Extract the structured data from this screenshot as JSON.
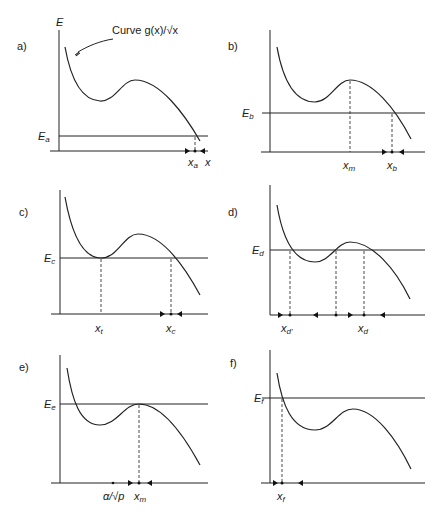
{
  "figure": {
    "annotation": "Curve g(x)/√x",
    "y_axis_label": "E",
    "x_axis_label": "x",
    "panels": [
      {
        "id": "a",
        "label": "a)",
        "energy_label": "E",
        "energy_sub": "a",
        "points": [
          {
            "name": "x",
            "sub": "a"
          }
        ],
        "extra_axis_label": "x"
      },
      {
        "id": "b",
        "label": "b)",
        "energy_label": "E",
        "energy_sub": "b",
        "points": [
          {
            "name": "x",
            "sub": "m"
          },
          {
            "name": "x",
            "sub": "b"
          }
        ]
      },
      {
        "id": "c",
        "label": "c)",
        "energy_label": "E",
        "energy_sub": "c",
        "points": [
          {
            "name": "x",
            "sub": "t"
          },
          {
            "name": "x",
            "sub": "c"
          }
        ]
      },
      {
        "id": "d",
        "label": "d)",
        "energy_label": "E",
        "energy_sub": "d",
        "points": [
          {
            "name": "x",
            "sub": "d'"
          },
          {
            "name": "x",
            "sub": "d"
          }
        ]
      },
      {
        "id": "e",
        "label": "e)",
        "energy_label": "E",
        "energy_sub": "e",
        "points": [
          {
            "name": "α/√p",
            "sub": ""
          },
          {
            "name": "x",
            "sub": "m"
          }
        ]
      },
      {
        "id": "f",
        "label": "f)",
        "energy_label": "E",
        "energy_sub": "f",
        "points": [
          {
            "name": "x",
            "sub": "f"
          }
        ]
      }
    ]
  }
}
